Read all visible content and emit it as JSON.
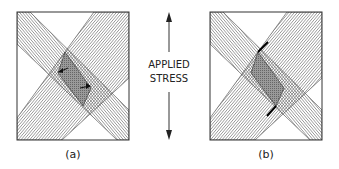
{
  "figure": {
    "panels": [
      {
        "id": "a",
        "label": "(a)",
        "description": "Two crossing slip bands with shear arrows at intersection"
      },
      {
        "id": "b",
        "label": "(b)",
        "description": "Two crossing slip bands with offset at intersection"
      }
    ],
    "stress_label_line1": "APPLIED",
    "stress_label_line2": "STRESS",
    "colors": {
      "frame": "#333333",
      "hatch": "#555555",
      "intersection": "#777777",
      "background": "#ffffff"
    }
  }
}
